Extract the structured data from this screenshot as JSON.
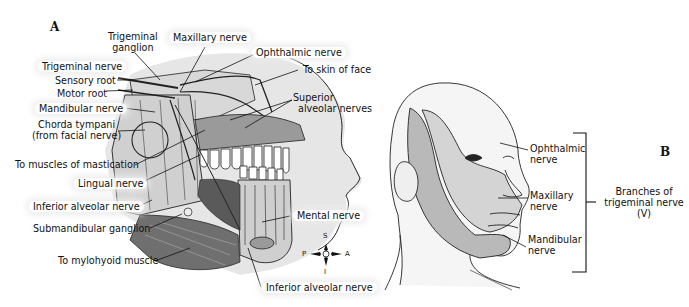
{
  "panel_a": {
    "letter": "A",
    "labels": {
      "trigeminal_ganglion": [
        "Trigeminal",
        "ganglion"
      ],
      "maxillary_nerve": "Maxillary nerve",
      "ophthalmic_nerve": "Ophthalmic nerve",
      "to_skin_of_face": "To skin of face",
      "trigeminal_nerve": "Trigeminal nerve",
      "sensory_root": "Sensory root",
      "motor_root": "Motor root",
      "mandibular_nerve": "Mandibular nerve",
      "chorda_tympani": [
        "Chorda tympani",
        "(from facial nerve)"
      ],
      "superior_alveolar_nerves": [
        "Superior",
        "alveolar nerves"
      ],
      "to_muscles_of_mastication": "To muscles of mastication",
      "lingual_nerve": "Lingual nerve",
      "inferior_alveolar_nerve_left": "Inferior alveolar nerve",
      "submandibular_ganglion": "Submandibular ganglion",
      "to_mylohyoid_muscle": "To mylohyoid muscle",
      "mental_nerve": "Mental nerve",
      "inferior_alveolar_nerve_bottom": "Inferior alveolar nerve"
    },
    "compass": {
      "superior": "S",
      "inferior": "I",
      "posterior": "P",
      "anterior": "A"
    }
  },
  "panel_b": {
    "letter": "B",
    "labels": {
      "ophthalmic": [
        "Ophthalmic",
        "nerve"
      ],
      "maxillary": [
        "Maxillary",
        "nerve"
      ],
      "mandibular": [
        "Mandibular",
        "nerve"
      ]
    },
    "bracket_caption": [
      "Branches of",
      "trigeminal nerve",
      "(V)"
    ]
  },
  "colors": {
    "background": "#ffffff",
    "ink": "#111111",
    "shade_light": "#e6e6e6",
    "shade_mid": "#cfcfcf",
    "shade_dark": "#b9b9b9",
    "muscle": "#6f6f6f"
  }
}
